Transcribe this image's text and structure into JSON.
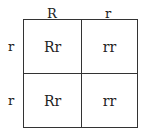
{
  "punnett_square": {
    "column_headers": [
      "R",
      "r"
    ],
    "row_headers": [
      "r",
      "r"
    ],
    "cells": [
      [
        "Rr",
        "rr"
      ],
      [
        "Rr",
        "rr"
      ]
    ]
  }
}
